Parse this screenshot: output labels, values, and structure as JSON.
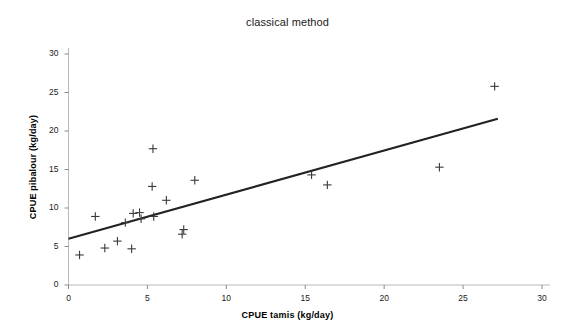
{
  "chart_data": {
    "type": "scatter",
    "title": "classical method",
    "xlabel": "CPUE tamis (kg/day)",
    "ylabel": "CPUE pibalour (kg/day)",
    "xlim": [
      0,
      30
    ],
    "ylim": [
      0,
      30
    ],
    "xticks": [
      0,
      5,
      10,
      15,
      20,
      25,
      30
    ],
    "yticks": [
      0,
      5,
      10,
      15,
      20,
      25,
      30
    ],
    "xtick_labels": [
      "0",
      "5",
      "10",
      "15",
      "20",
      "25",
      "30"
    ],
    "ytick_labels": [
      "0",
      "5",
      "10",
      "15",
      "20",
      "25",
      "30"
    ],
    "grid": false,
    "legend": false,
    "marker": "plus",
    "marker_color": "#3a3a3a",
    "line_color": "#222222",
    "series": [
      {
        "name": "observations",
        "marker": "plus",
        "points": [
          [
            0.7,
            3.9
          ],
          [
            1.7,
            8.9
          ],
          [
            2.3,
            4.8
          ],
          [
            3.1,
            5.7
          ],
          [
            3.6,
            8.1
          ],
          [
            4.0,
            4.7
          ],
          [
            4.1,
            9.3
          ],
          [
            4.5,
            9.4
          ],
          [
            4.6,
            8.6
          ],
          [
            5.3,
            12.8
          ],
          [
            5.35,
            17.7
          ],
          [
            5.4,
            8.9
          ],
          [
            6.2,
            11.0
          ],
          [
            7.2,
            6.6
          ],
          [
            7.3,
            7.2
          ],
          [
            8.0,
            13.6
          ],
          [
            15.4,
            14.3
          ],
          [
            16.4,
            13.0
          ],
          [
            23.5,
            15.3
          ],
          [
            27.0,
            25.8
          ]
        ]
      }
    ],
    "trendline": {
      "name": "regression line",
      "x0": 0.0,
      "y0": 6.0,
      "x1": 27.2,
      "y1": 21.6
    }
  }
}
